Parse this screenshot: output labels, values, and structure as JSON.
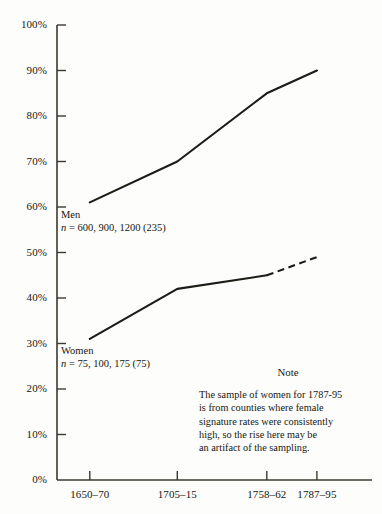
{
  "chart_data": {
    "type": "line",
    "title": "",
    "xlabel": "",
    "ylabel": "",
    "categories": [
      "1650–70",
      "1705–15",
      "1758–62",
      "1787–95"
    ],
    "x_positions_pct": [
      10.4,
      38.2,
      66.6,
      82.5
    ],
    "ylim": [
      0,
      100
    ],
    "y_ticks": [
      "0%",
      "10%",
      "20%",
      "30%",
      "40%",
      "50%",
      "60%",
      "70%",
      "80%",
      "90%",
      "100%"
    ],
    "y_tick_values": [
      0,
      10,
      20,
      30,
      40,
      50,
      60,
      70,
      80,
      90,
      100
    ],
    "grid": false,
    "legend_position": "inline-annotation",
    "series": [
      {
        "name": "Men",
        "values": [
          61,
          70,
          85,
          90
        ],
        "style": "solid",
        "color": "#1c1c16",
        "dashed_from_index": null,
        "annotation_label": "Men",
        "annotation_n": "n = 600, 900, 1200 (235)"
      },
      {
        "name": "Women",
        "values": [
          31,
          42,
          45,
          49
        ],
        "style": "solid-then-dashed",
        "color": "#1c1c16",
        "dashed_from_index": 2,
        "annotation_label": "Women",
        "annotation_n": "n = 75, 100, 175 (75)"
      }
    ],
    "annotations": [
      {
        "name": "note",
        "title": "Note",
        "lines": [
          "The sample of women for 1787-95",
          "is from counties where female",
          "signature rates were consistently",
          "high, so the rise here may be",
          "an artifact of the sampling."
        ]
      }
    ]
  },
  "axes": {
    "y_labels": [
      "100%",
      "90%",
      "80%",
      "70%",
      "60%",
      "50%",
      "40%",
      "30%",
      "20%",
      "10%",
      "0%"
    ],
    "x_labels": [
      "1650–70",
      "1705–15",
      "1758–62",
      "1787–95"
    ],
    "axis_color": "#3a3a30"
  },
  "series_annotations": {
    "men": {
      "label": "Men",
      "n_prefix": "n",
      "n_rest": " = 600, 900, 1200 (235)"
    },
    "women": {
      "label": "Women",
      "n_prefix": "n",
      "n_rest": " = 75, 100, 175 (75)"
    }
  },
  "note": {
    "title": "Note",
    "line1": "The sample of women for 1787-95",
    "line2": "is from counties where female",
    "line3": "signature rates were consistently",
    "line4": "high, so the rise here may be",
    "line5": "an artifact of the sampling."
  },
  "page_top_fragment": ""
}
